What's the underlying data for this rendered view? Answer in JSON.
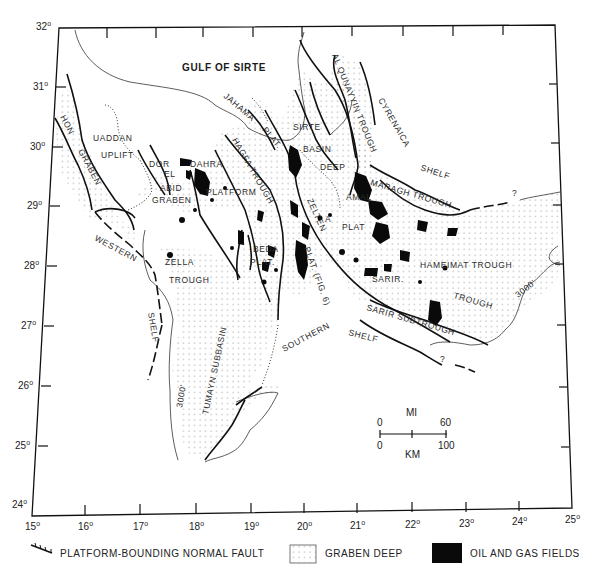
{
  "map": {
    "title": "GULF OF SIRTE",
    "frame_color": "#111111",
    "field_color": "#0a0a0a",
    "dot_color": "#8a8a8a",
    "latitude_labels": [
      {
        "deg": "32",
        "y": 30
      },
      {
        "deg": "31",
        "y": 88
      },
      {
        "deg": "30",
        "y": 147
      },
      {
        "deg": "29",
        "y": 206
      },
      {
        "deg": "28",
        "y": 266
      },
      {
        "deg": "27",
        "y": 326
      },
      {
        "deg": "26",
        "y": 386
      },
      {
        "deg": "25",
        "y": 446
      },
      {
        "deg": "24",
        "y": 505
      }
    ],
    "longitude_labels": [
      "15",
      "16",
      "17",
      "18",
      "19",
      "20",
      "21",
      "22",
      "23",
      "24",
      "25"
    ],
    "degree_symbol": "o",
    "region_labels": {
      "hon_graben_1": "HON",
      "hon_graben_2": "GRABEN",
      "uaddan": "UADDAN",
      "uplift": "UPLIFT",
      "dor": "DOR",
      "el": "EL",
      "abid": "ABID",
      "graben": "GRABEN",
      "dahra": "DAHRA",
      "platform": "PLATFORM",
      "jahama": "JAHAMA",
      "plat_jahama": "PLAT.",
      "hagfa_trough": "HAGFA TROUGH",
      "sirte": "SIRTE",
      "basin": "BASIN",
      "deep": "DEEP",
      "al_qunayyin_trough": "AL QUNAYYIN TROUGH",
      "cyrenaica": "CYRENAICA",
      "shelf_cyrenaica": "SHELF",
      "maragh_trough": "MARAGH TROUGH",
      "amal": "AMAL",
      "a": "A",
      "plat_amal": "PLAT",
      "zelten": "ZELTEN",
      "zelten_plat": "PLAT. (FIG. 6)",
      "beda": "BEDA",
      "plat_beda": "PLAT.",
      "zella": "ZELLA",
      "trough_zella": "TROUGH",
      "western": "WESTERN",
      "shelf_western": "SHELF",
      "tumayn_subbasin": "TUMAYN SUBBASIN",
      "southern": "SOUTHERN",
      "shelf_southern": "SHELF",
      "hameimat_trough": "HAMEIMAT TROUGH",
      "sarir": "SARIR.",
      "trough_sarir": "TROUGH",
      "sarir_subtrough": "SARIR SUBTROUGH",
      "contour_3000_west": "3000'",
      "contour_3000_east": "3000'",
      "query_1": "?",
      "query_2": "?"
    },
    "scale_bar": {
      "top_unit": "MI",
      "top_min": "0",
      "top_max": "60",
      "bottom_min": "0",
      "bottom_max": "100",
      "bottom_unit": "KM"
    }
  },
  "legend": {
    "items": [
      {
        "symbol": "fault-symbol",
        "label": "PLATFORM-BOUNDING NORMAL FAULT"
      },
      {
        "symbol": "dot-pattern",
        "label": "GRABEN DEEP"
      },
      {
        "symbol": "solid-black",
        "label": "OIL AND GAS FIELDS"
      }
    ]
  }
}
